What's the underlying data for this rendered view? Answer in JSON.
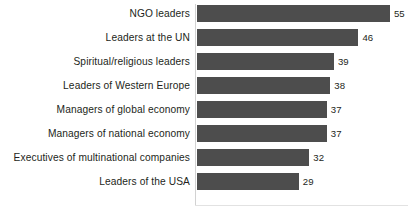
{
  "chart_data": {
    "type": "bar",
    "orientation": "horizontal",
    "title": "",
    "subtitle": "",
    "xlabel": "",
    "ylabel": "",
    "categories": [
      "NGO leaders",
      "Leaders at the UN",
      "Spiritual/religious leaders",
      "Leaders of Western Europe",
      "Managers of global economy",
      "Managers of national economy",
      "Executives of multinational companies",
      "Leaders of the USA"
    ],
    "values": [
      55,
      46,
      39,
      38,
      37,
      37,
      32,
      29
    ],
    "value_labels": [
      "55",
      "46",
      "39",
      "38",
      "37",
      "37",
      "32",
      "29"
    ],
    "xlim": [
      0,
      60
    ],
    "grid": false,
    "legend": false,
    "legend_position": "none",
    "tick_labels_x": [],
    "tick_labels_y": [
      "NGO leaders",
      "Leaders at the UN",
      "Spiritual/religious leaders",
      "Leaders of Western Europe",
      "Managers of global economy",
      "Managers of national economy",
      "Executives of multinational companies",
      "Leaders of the USA"
    ],
    "annotations": [],
    "colors": {
      "bar_fill": "#4d4d4d",
      "background": "#ffffff",
      "label_text": "#231f20",
      "value_text": "#231f20",
      "axis_line": "#d2d2d2",
      "baseline": "#e2e2e2"
    }
  }
}
